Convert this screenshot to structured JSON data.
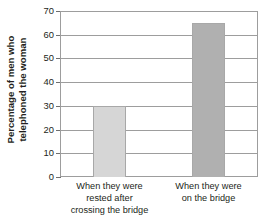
{
  "chart_data": {
    "type": "bar",
    "title": "",
    "subtitle": "",
    "xlabel": "",
    "ylabel": "Percentage of men who telephoned the woman",
    "ylabel_lines": [
      "Percentage of men who",
      "telephoned the woman"
    ],
    "categories": [
      "When they were rested after crossing the bridge",
      "When they were on the bridge"
    ],
    "category_lines": [
      [
        "When they were",
        "rested after",
        "crossing the bridge"
      ],
      [
        "When they were",
        "on the bridge"
      ]
    ],
    "values": [
      30,
      65
    ],
    "ylim": [
      0,
      70
    ],
    "ytick_step": 10,
    "yticks": [
      0,
      10,
      20,
      30,
      40,
      50,
      60,
      70
    ],
    "ytick_labels": [
      "0",
      "10",
      "20",
      "30",
      "40",
      "50",
      "60",
      "70"
    ],
    "grid": true,
    "grid_axis": "y",
    "legend": false,
    "legend_position": "none",
    "bar_colors": [
      "#d6d6d6",
      "#b0b0b0"
    ],
    "bar_border_color": "#a8a8a8",
    "axis_color": "#9d9d9d",
    "text_color": "#231f20",
    "background_color": "#ffffff"
  }
}
